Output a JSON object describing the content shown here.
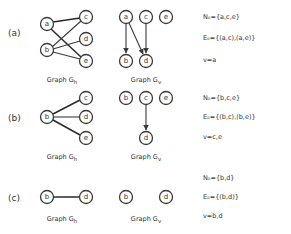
{
  "parts": [
    {
      "label": "(a)",
      "gh": {
        "title_main": "Graph G",
        "title_sub": "h",
        "nodes": {
          "a": "a",
          "b": "b",
          "c": "c",
          "d": "d",
          "e": "e"
        },
        "edges": [
          [
            "a",
            "c"
          ],
          [
            "a",
            "e"
          ],
          [
            "b",
            "c"
          ],
          [
            "b",
            "d"
          ],
          [
            "b",
            "e"
          ]
        ]
      },
      "gv": {
        "title_main": "Graph G",
        "title_sub": "v",
        "nodes": {
          "a": "a",
          "c": "c",
          "e": "e",
          "b": "b",
          "d": "d"
        },
        "edges": [
          [
            "a",
            "b"
          ],
          [
            "a",
            "d"
          ],
          [
            "c",
            "d"
          ]
        ]
      },
      "n0": "N₀={a,c,e}",
      "e0": "E₀={(a,c),(a,e)}",
      "v": "v=a"
    },
    {
      "label": "(b)",
      "gh": {
        "title_main": "Graph G",
        "title_sub": "h",
        "nodes": {
          "b": "b",
          "c": "c",
          "d": "d",
          "e": "e"
        },
        "edges": [
          [
            "b",
            "c"
          ],
          [
            "b",
            "d"
          ],
          [
            "b",
            "e"
          ]
        ]
      },
      "gv": {
        "title_main": "Graph G",
        "title_sub": "v",
        "nodes": {
          "b": "b",
          "c": "c",
          "e": "e",
          "d": "d"
        },
        "edges": [
          [
            "c",
            "d"
          ]
        ]
      },
      "n0": "N₀={b,c,e}",
      "e0": "E₀={(b,c),(b,e)}",
      "v": "v=c,e"
    },
    {
      "label": "(c)",
      "gh": {
        "title_main": "Graph G",
        "title_sub": "h",
        "nodes": {
          "b": "b",
          "d": "d"
        },
        "edges": [
          [
            "b",
            "d"
          ]
        ]
      },
      "gv": {
        "title_main": "Graph G",
        "title_sub": "v",
        "nodes": {
          "b": "b",
          "d": "d"
        },
        "edges": []
      },
      "n0": "N₀={b,d}",
      "e0": "E₀={(b,d)}",
      "v": "v=b,d"
    }
  ]
}
